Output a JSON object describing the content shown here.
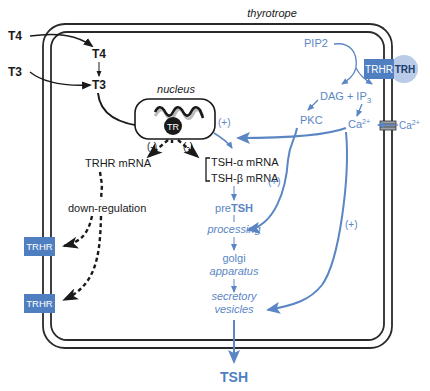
{
  "diagram": {
    "cell_label": "thyrotrope",
    "nucleus_label": "nucleus",
    "receptor_in_nucleus": "TR",
    "inputs": {
      "t4_outside": "T4",
      "t3_outside": "T3",
      "t4_inside": "T4",
      "t3_inside": "T3"
    },
    "signaling": {
      "pip2": "PIP2",
      "dag": "DAG + IP",
      "ip_sub": "3",
      "pkc": "PKC",
      "ca_inside": "Ca",
      "ca_inside_sup": "2+",
      "ca_outside": "Ca",
      "ca_outside_sup": "2+",
      "trhr_surface": "TRHR",
      "trh": "TRH"
    },
    "regulation_signs": {
      "nucleus_plus": "(+)",
      "minus_left": "(-)",
      "minus_right": "(-)",
      "pkc_plus": "(+)",
      "ca_plus": "(+)"
    },
    "mrna": {
      "trhr": "TRHR mRNA",
      "tsh_alpha": "TSH-α mRNA",
      "tsh_beta": "TSH-β mRNA"
    },
    "down_regulation": "down-regulation",
    "membrane_trhr": [
      "TRHR",
      "TRHR"
    ],
    "secretion_path": {
      "pre": "pre",
      "pre_bold": "TSH",
      "processing": "processing",
      "golgi_1": "golgi",
      "golgi_2": "apparatus",
      "secretory_1": "secretory",
      "secretory_2": "vesicles"
    },
    "output": "TSH",
    "colors": {
      "black": "#1a1a1a",
      "blue": "#5b86c4",
      "blue_box": "#4f7fc0",
      "trh_circle": "#b9cbe6"
    }
  }
}
